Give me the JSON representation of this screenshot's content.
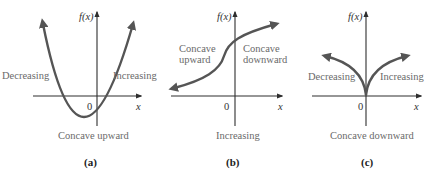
{
  "colors": {
    "background": "#ffffff",
    "axis": "#2e2e2e",
    "curve": "#555555",
    "label_text": "#6a6a6a",
    "caption_text": "#222222"
  },
  "panels": [
    {
      "id": "a",
      "caption": "(a)",
      "y_axis_label": "f(x)",
      "x_axis_label": "x",
      "origin_label": "0",
      "left_label": "Decreasing",
      "right_label": "Increasing",
      "bottom_label": "Concave upward",
      "curve": "parabola opening upward, vertex below x-axis left of origin"
    },
    {
      "id": "b",
      "caption": "(b)",
      "y_axis_label": "f(x)",
      "x_axis_label": "x",
      "origin_label": "0",
      "left_label_line1": "Concave",
      "left_label_line2": "upward",
      "right_label_line1": "Concave",
      "right_label_line2": "downward",
      "bottom_label": "Increasing",
      "curve": "increasing S-curve with inflection point left of y-axis"
    },
    {
      "id": "c",
      "caption": "(c)",
      "y_axis_label": "f(x)",
      "x_axis_label": "x",
      "origin_label": "0",
      "left_label": "Decreasing",
      "right_label": "Increasing",
      "bottom_label": "Concave downward",
      "curve": "cusp at origin, both arms rising and concave downward"
    }
  ]
}
